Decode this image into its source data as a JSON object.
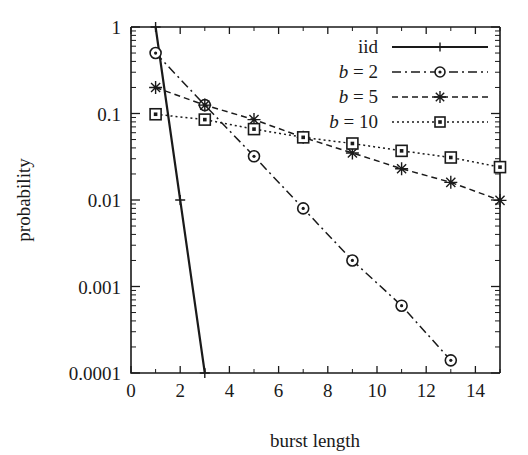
{
  "figure": {
    "background_color": "#ffffff",
    "ink_color": "#1a1a1a"
  },
  "axes": {
    "x_label": "burst length",
    "y_label": "probability",
    "x_ticks": [
      "0",
      "2",
      "4",
      "6",
      "8",
      "10",
      "12",
      "14"
    ],
    "x_tick_values": [
      0,
      2,
      4,
      6,
      8,
      10,
      12,
      14
    ],
    "y_ticks": [
      "1",
      "0.1",
      "0.01",
      "0.001",
      "0.0001"
    ],
    "y_tick_values": [
      1,
      0.1,
      0.01,
      0.001,
      0.0001
    ],
    "x_range": [
      0,
      15
    ],
    "y_range": [
      0.0001,
      1
    ],
    "y_scale": "log",
    "x_scale": "linear",
    "grid": false
  },
  "legend": {
    "position": "top-right",
    "entries": [
      {
        "label": "iid",
        "style": "solid",
        "marker": "plus"
      },
      {
        "label": "b = 2",
        "style": "dash-dot",
        "marker": "circle"
      },
      {
        "label": "b = 5",
        "style": "dotted-dash",
        "marker": "star"
      },
      {
        "label": "b = 10",
        "style": "dotted",
        "marker": "square"
      }
    ]
  },
  "chart_data": {
    "type": "line",
    "title": "",
    "xlabel": "burst length",
    "ylabel": "probability",
    "xlim": [
      0,
      15
    ],
    "ylim": [
      0.0001,
      1
    ],
    "yscale": "log",
    "grid": false,
    "legend_position": "top-right",
    "series": [
      {
        "name": "iid",
        "marker": "plus",
        "linestyle": "solid",
        "x": [
          1,
          2,
          3
        ],
        "y": [
          1.0,
          0.01,
          0.0001
        ]
      },
      {
        "name": "b = 2",
        "marker": "circle",
        "linestyle": "dash-dot",
        "x": [
          1,
          3,
          5,
          7,
          9,
          11,
          13
        ],
        "y": [
          0.5,
          0.125,
          0.032,
          0.008,
          0.002,
          0.0006,
          0.00014
        ]
      },
      {
        "name": "b = 5",
        "marker": "star",
        "linestyle": "dotted-dash",
        "x": [
          1,
          3,
          5,
          7,
          9,
          11,
          13,
          15
        ],
        "y": [
          0.2,
          0.125,
          0.085,
          0.053,
          0.035,
          0.023,
          0.016,
          0.0099
        ]
      },
      {
        "name": "b = 10",
        "marker": "square",
        "linestyle": "dotted",
        "x": [
          1,
          3,
          5,
          7,
          9,
          11,
          13,
          15
        ],
        "y": [
          0.098,
          0.085,
          0.066,
          0.053,
          0.045,
          0.037,
          0.031,
          0.024
        ]
      }
    ]
  }
}
